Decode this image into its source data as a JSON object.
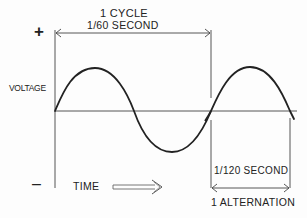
{
  "diagram": {
    "labels": {
      "plus": "+",
      "minus": "–",
      "voltage": "VOLTAGE",
      "time": "TIME",
      "cycle": "1 CYCLE",
      "cycle_duration": "1/60 SECOND",
      "alternation_duration": "1/120 SECOND",
      "alternation": "1 ALTERNATION"
    },
    "colors": {
      "ink": "#222222",
      "axis": "#555555",
      "background": "#fdfdfd"
    }
  }
}
